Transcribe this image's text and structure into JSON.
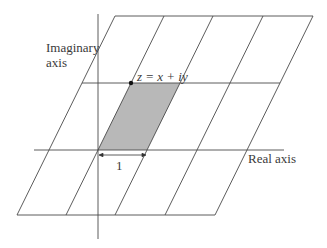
{
  "diagram": {
    "colors": {
      "line": "#4a4a4a",
      "shade": "#b8b8b8",
      "point": "#111111",
      "text": "#3a3a3a"
    },
    "labels": {
      "imaginary_axis_line1": "Imaginary",
      "imaginary_axis_line2": "axis",
      "real_axis": "Real axis",
      "point": "z = x + iy",
      "unit": "1"
    },
    "grid": {
      "horizontal_lines": [
        {
          "y": 16,
          "x1": 115,
          "x2": 313
        },
        {
          "y": 83,
          "x1": 82,
          "x2": 280
        },
        {
          "y": 150,
          "x1": 34,
          "x2": 284
        },
        {
          "y": 215,
          "x1": 17,
          "x2": 215
        }
      ],
      "slanted_lines_top_x": [
        115,
        164,
        213,
        263,
        313
      ],
      "slanted_lines_bottom_x": [
        17,
        66,
        115,
        165,
        215
      ],
      "imaginary_axis": {
        "x": 98,
        "y1": 14,
        "y2": 239
      },
      "shaded_cell": [
        [
          131,
          83
        ],
        [
          180,
          83
        ],
        [
          147,
          150
        ],
        [
          98,
          150
        ]
      ],
      "point_z": {
        "x": 131,
        "y": 83
      }
    }
  }
}
